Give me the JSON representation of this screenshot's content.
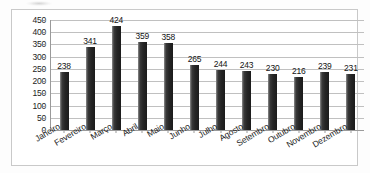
{
  "chart_data": {
    "type": "bar",
    "title": "",
    "xlabel": "",
    "ylabel": "",
    "categories": [
      "Janeiro",
      "Fevereiro",
      "Março",
      "Abril",
      "Maio",
      "Junho",
      "Julho",
      "Agosto",
      "Setembro",
      "Outubro",
      "Novembro",
      "Dezembro"
    ],
    "values": [
      238,
      341,
      424,
      359,
      358,
      265,
      244,
      243,
      230,
      216,
      239,
      231
    ],
    "yticks": [
      0,
      50,
      100,
      150,
      200,
      250,
      300,
      350,
      400,
      450
    ],
    "ylim": [
      0,
      450
    ],
    "grid": true,
    "legend": false,
    "data_labels": true,
    "bar_color": "#262626",
    "gridline_color": "#c0c0c0",
    "axis_color": "#9a9a9a",
    "background_color": "#ffffff",
    "border_color": "#c9c9c9"
  }
}
